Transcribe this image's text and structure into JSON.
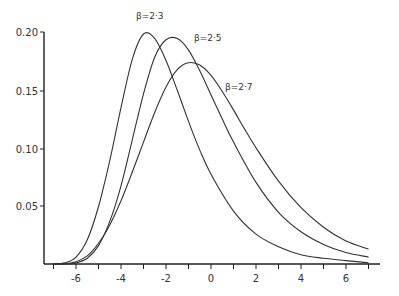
{
  "chart_data": {
    "type": "line",
    "title": "",
    "xlabel": "",
    "ylabel": "",
    "xlim": [
      -7.5,
      7.5
    ],
    "ylim": [
      0,
      0.21
    ],
    "grid": false,
    "legend_position": "inline labels near curve peaks",
    "x_ticks": [
      -6,
      -4,
      -2,
      0,
      2,
      4,
      6
    ],
    "x_tick_labels": [
      "-6",
      "-4",
      "-2",
      "0",
      "2",
      "4",
      "6"
    ],
    "x_minor_ticks": [
      -7,
      -5,
      -3,
      -1,
      1,
      3,
      5,
      7
    ],
    "y_ticks": [
      0.05,
      0.1,
      0.15,
      0.2
    ],
    "y_tick_labels": [
      "0.05",
      "0.10",
      "0.15",
      "0.20"
    ],
    "series": [
      {
        "name": "β=2.3",
        "label": "β=2·3",
        "mode_x": -3.0,
        "peak_y": 0.2,
        "x": [
          -7,
          -6.5,
          -6,
          -5.5,
          -5,
          -4.5,
          -4,
          -3.5,
          -3,
          -2.5,
          -2,
          -1.5,
          -1,
          -0.5,
          0,
          1,
          2,
          3,
          4,
          5,
          6,
          7
        ],
        "values": [
          0.0,
          0.001,
          0.006,
          0.021,
          0.05,
          0.09,
          0.136,
          0.178,
          0.2,
          0.196,
          0.177,
          0.151,
          0.124,
          0.099,
          0.078,
          0.046,
          0.026,
          0.015,
          0.008,
          0.005,
          0.003,
          0.001
        ]
      },
      {
        "name": "β=2.5",
        "label": "β=2·5",
        "mode_x": -1.6,
        "peak_y": 0.196,
        "x": [
          -7,
          -6.5,
          -6,
          -5.5,
          -5,
          -4.5,
          -4,
          -3.5,
          -3,
          -2.5,
          -2,
          -1.5,
          -1,
          -0.5,
          0,
          0.5,
          1,
          2,
          3,
          4,
          5,
          6,
          7
        ],
        "values": [
          0.0,
          0.0,
          0.001,
          0.005,
          0.016,
          0.037,
          0.068,
          0.108,
          0.148,
          0.18,
          0.195,
          0.196,
          0.186,
          0.168,
          0.147,
          0.126,
          0.106,
          0.071,
          0.045,
          0.028,
          0.017,
          0.01,
          0.006
        ]
      },
      {
        "name": "β=2.7",
        "label": "β=2·7",
        "mode_x": -0.9,
        "peak_y": 0.175,
        "x": [
          -7,
          -6.5,
          -6,
          -5.5,
          -5,
          -4.5,
          -4,
          -3.5,
          -3,
          -2.5,
          -2,
          -1.5,
          -1,
          -0.5,
          0,
          0.5,
          1,
          1.5,
          2,
          3,
          4,
          5,
          6,
          7
        ],
        "values": [
          0.0,
          0.0,
          0.002,
          0.007,
          0.018,
          0.034,
          0.055,
          0.08,
          0.106,
          0.132,
          0.154,
          0.169,
          0.175,
          0.173,
          0.164,
          0.15,
          0.134,
          0.117,
          0.101,
          0.072,
          0.049,
          0.032,
          0.02,
          0.013
        ]
      }
    ]
  },
  "labels": {
    "series_0": "β=2·3",
    "series_1": "β=2·5",
    "series_2": "β=2·7",
    "y_ticks": [
      "0.05",
      "0.10",
      "0.15",
      "0.20"
    ],
    "x_ticks": [
      "-6",
      "-4",
      "-2",
      "0",
      "2",
      "4",
      "6"
    ]
  }
}
